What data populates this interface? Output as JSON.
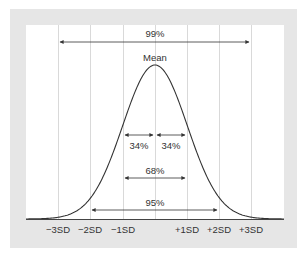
{
  "diagram": {
    "type": "normal-distribution",
    "title": "",
    "peak_label": "Mean",
    "axis_ticks": [
      {
        "label": "−3SD",
        "x": 58
      },
      {
        "label": "−2SD",
        "x": 90
      },
      {
        "label": "−1SD",
        "x": 123
      },
      {
        "label": "+1SD",
        "x": 187
      },
      {
        "label": "+2SD",
        "x": 219
      },
      {
        "label": "+3SD",
        "x": 251
      }
    ],
    "gridlines_x": [
      58,
      90,
      123,
      155,
      187,
      219,
      251
    ],
    "ranges": [
      {
        "label": "99%",
        "from": "−3SD",
        "to": "+3SD"
      },
      {
        "label": "34%",
        "from": "−1SD",
        "to": "Mean"
      },
      {
        "label": "34%",
        "from": "Mean",
        "to": "+1SD"
      },
      {
        "label": "68%",
        "from": "−1SD",
        "to": "+1SD"
      },
      {
        "label": "95%",
        "from": "−2SD",
        "to": "+2SD"
      }
    ],
    "colors": {
      "frame": "#e6e6e6",
      "panel": "#ffffff",
      "gridline": "#d9d9d9",
      "curve": "#333333",
      "arrow": "#333333",
      "text": "#333333"
    }
  }
}
